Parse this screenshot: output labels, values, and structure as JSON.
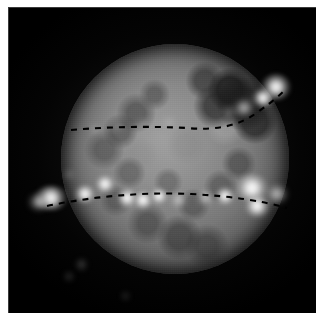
{
  "figure": {
    "domain_label": "astronomical-image",
    "background_color": "#000000",
    "paper_color": "#ffffff",
    "disk_color": "#7e7e7e",
    "overlay_color": "#000000",
    "emission_color": "#ffffff",
    "width": 318,
    "height": 316
  },
  "plate": {
    "left": 8,
    "top": 7,
    "width": 310,
    "height": 306
  },
  "disk": {
    "center_x": 166,
    "center_y": 151,
    "width": 228,
    "height": 230,
    "label": "planetary-disk"
  },
  "curves": [
    {
      "name": "upper-dashed-arc",
      "path": "M 62 122 Q 120 117 178 120 Q 220 124 246 106 Q 262 95 274 84",
      "dash": "6 6",
      "stroke_width": 2.1
    },
    {
      "name": "lower-dashed-arc",
      "path": "M 38 198 Q 110 183 182 186 Q 240 189 278 200",
      "dash": "6 6",
      "stroke_width": 2.1
    }
  ],
  "emission_spots": [
    {
      "name": "limb-spot-upper-right",
      "x": 267,
      "y": 79,
      "w": 30,
      "h": 26,
      "class": "spot"
    },
    {
      "name": "limb-spot-upper-right-b",
      "x": 254,
      "y": 90,
      "w": 22,
      "h": 18,
      "class": "spot"
    },
    {
      "name": "glow-upper-right-inner",
      "x": 235,
      "y": 100,
      "w": 20,
      "h": 16,
      "class": "soft"
    },
    {
      "name": "glow-upper-right-arc",
      "x": 220,
      "y": 104,
      "w": 14,
      "h": 12,
      "class": "faint"
    },
    {
      "name": "patch-upper-mid",
      "x": 160,
      "y": 114,
      "w": 16,
      "h": 11,
      "class": "faint"
    },
    {
      "name": "patch-upper-left",
      "x": 108,
      "y": 118,
      "w": 14,
      "h": 10,
      "class": "faint"
    },
    {
      "name": "patch-upper-left-b",
      "x": 86,
      "y": 121,
      "w": 12,
      "h": 9,
      "class": "faint"
    },
    {
      "name": "patch-upper-center",
      "x": 133,
      "y": 116,
      "w": 13,
      "h": 10,
      "class": "faint"
    },
    {
      "name": "limb-spot-left",
      "x": 42,
      "y": 190,
      "w": 34,
      "h": 24,
      "class": "spot"
    },
    {
      "name": "limb-spot-left-outer",
      "x": 30,
      "y": 194,
      "w": 22,
      "h": 16,
      "class": "soft"
    },
    {
      "name": "blob-lower-left-a",
      "x": 76,
      "y": 186,
      "w": 22,
      "h": 18,
      "class": "spot"
    },
    {
      "name": "blob-lower-left-b",
      "x": 96,
      "y": 176,
      "w": 20,
      "h": 18,
      "class": "spot"
    },
    {
      "name": "blob-center-left",
      "x": 118,
      "y": 190,
      "w": 18,
      "h": 22,
      "class": "spot"
    },
    {
      "name": "blob-center-a",
      "x": 134,
      "y": 192,
      "w": 16,
      "h": 22,
      "class": "spot"
    },
    {
      "name": "blob-center-b",
      "x": 150,
      "y": 188,
      "w": 18,
      "h": 16,
      "class": "spot"
    },
    {
      "name": "blob-center-c",
      "x": 170,
      "y": 192,
      "w": 16,
      "h": 14,
      "class": "soft"
    },
    {
      "name": "blob-center-right",
      "x": 196,
      "y": 190,
      "w": 16,
      "h": 14,
      "class": "soft"
    },
    {
      "name": "blob-right-a",
      "x": 216,
      "y": 188,
      "w": 20,
      "h": 18,
      "class": "spot"
    },
    {
      "name": "limb-spot-right",
      "x": 243,
      "y": 180,
      "w": 34,
      "h": 28,
      "class": "spot"
    },
    {
      "name": "limb-spot-right-b",
      "x": 248,
      "y": 198,
      "w": 26,
      "h": 22,
      "class": "spot"
    },
    {
      "name": "limb-spot-right-outer",
      "x": 268,
      "y": 186,
      "w": 22,
      "h": 18,
      "class": "soft"
    },
    {
      "name": "outlier-below-left",
      "x": 72,
      "y": 256,
      "w": 9,
      "h": 11,
      "class": "faint"
    },
    {
      "name": "outlier-below-left-b",
      "x": 60,
      "y": 268,
      "w": 8,
      "h": 7,
      "class": "faint"
    },
    {
      "name": "outlier-below-center",
      "x": 116,
      "y": 288,
      "w": 7,
      "h": 6,
      "class": "faint"
    },
    {
      "name": "outlier-disk-left",
      "x": 60,
      "y": 166,
      "w": 10,
      "h": 9,
      "class": "faint"
    }
  ]
}
